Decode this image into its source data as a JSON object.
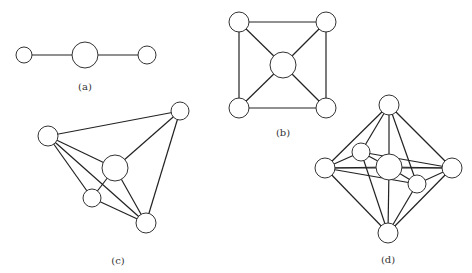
{
  "figures": [
    {
      "id": "a",
      "label": "(a)",
      "label_pos": [
        85,
        81
      ],
      "nodes": [
        {
          "x": 24,
          "y": 55,
          "r": 8
        },
        {
          "x": 85,
          "y": 55,
          "r": 13
        },
        {
          "x": 147,
          "y": 55,
          "r": 9
        }
      ],
      "edges": [
        [
          0,
          1
        ],
        [
          1,
          2
        ]
      ]
    },
    {
      "id": "b",
      "label": "(b)",
      "label_pos": [
        283,
        127
      ],
      "nodes": [
        {
          "x": 239,
          "y": 22,
          "r": 10
        },
        {
          "x": 326,
          "y": 22,
          "r": 10
        },
        {
          "x": 239,
          "y": 108,
          "r": 10
        },
        {
          "x": 326,
          "y": 108,
          "r": 10
        },
        {
          "x": 283,
          "y": 65,
          "r": 13
        }
      ],
      "edges": [
        [
          0,
          1
        ],
        [
          0,
          2
        ],
        [
          1,
          3
        ],
        [
          2,
          3
        ],
        [
          0,
          4
        ],
        [
          1,
          4
        ],
        [
          2,
          4
        ],
        [
          3,
          4
        ]
      ]
    },
    {
      "id": "c",
      "label": "(c)",
      "label_pos": [
        118,
        255
      ],
      "nodes": [
        {
          "x": 180,
          "y": 111,
          "r": 9
        },
        {
          "x": 48,
          "y": 136,
          "r": 10
        },
        {
          "x": 115,
          "y": 168,
          "r": 13
        },
        {
          "x": 92,
          "y": 198,
          "r": 9
        },
        {
          "x": 146,
          "y": 223,
          "r": 10
        }
      ],
      "edges": [
        [
          1,
          0
        ],
        [
          0,
          2
        ],
        [
          0,
          4
        ],
        [
          1,
          2
        ],
        [
          1,
          3
        ],
        [
          1,
          4
        ],
        [
          2,
          3
        ],
        [
          2,
          4
        ],
        [
          3,
          4
        ]
      ]
    },
    {
      "id": "d",
      "label": "(d)",
      "label_pos": [
        388,
        254
      ],
      "nodes": [
        {
          "x": 389,
          "y": 105,
          "r": 10
        },
        {
          "x": 325,
          "y": 168,
          "r": 10
        },
        {
          "x": 361,
          "y": 152,
          "r": 9
        },
        {
          "x": 389,
          "y": 167,
          "r": 13
        },
        {
          "x": 417,
          "y": 184,
          "r": 9
        },
        {
          "x": 452,
          "y": 168,
          "r": 10
        },
        {
          "x": 388,
          "y": 233,
          "r": 10
        }
      ],
      "edges": [
        [
          0,
          1
        ],
        [
          0,
          2
        ],
        [
          0,
          3
        ],
        [
          0,
          4
        ],
        [
          0,
          5
        ],
        [
          6,
          1
        ],
        [
          6,
          2
        ],
        [
          6,
          3
        ],
        [
          6,
          4
        ],
        [
          6,
          5
        ],
        [
          1,
          2
        ],
        [
          2,
          5
        ],
        [
          1,
          5
        ],
        [
          1,
          4
        ],
        [
          4,
          5
        ],
        [
          2,
          3
        ],
        [
          3,
          4
        ],
        [
          3,
          5
        ],
        [
          1,
          3
        ]
      ]
    }
  ]
}
